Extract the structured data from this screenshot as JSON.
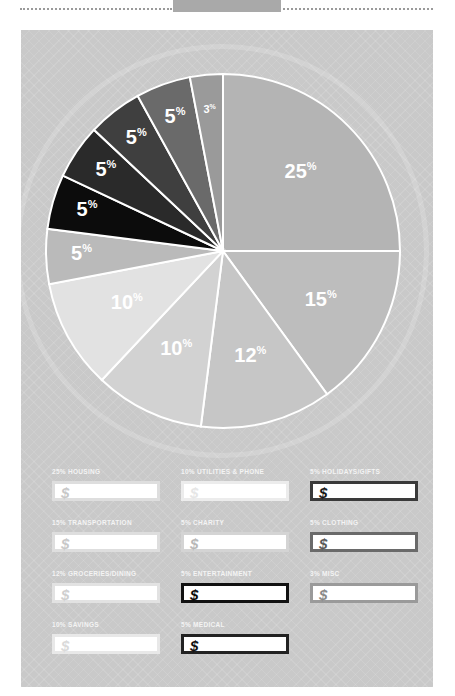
{
  "header": {
    "tab_color": "#a9a9a9"
  },
  "chart_data": {
    "type": "pie",
    "title": "",
    "start_angle": "12 o'clock, clockwise",
    "categories": [
      "Housing",
      "Transportation",
      "Groceries/Dining",
      "Savings",
      "Utilities & Phone",
      "Charity",
      "Entertainment",
      "Medical",
      "Holidays/Gifts",
      "Clothing",
      "Misc"
    ],
    "values": [
      25,
      15,
      12,
      10,
      10,
      5,
      5,
      5,
      5,
      5,
      3
    ],
    "labels": [
      "25%",
      "15%",
      "12%",
      "10%",
      "10%",
      "5%",
      "5%",
      "5%",
      "5%",
      "5%",
      "3%"
    ],
    "colors": [
      "#b4b4b4",
      "#bdbdbd",
      "#c6c6c6",
      "#d2d2d2",
      "#e2e2e2",
      "#bababa",
      "#0c0c0c",
      "#2a2a2a",
      "#3f3f3f",
      "#6a6a6a",
      "#9a9a9a"
    ],
    "label_colors": [
      "#ffffff",
      "#ffffff",
      "#ffffff",
      "#ffffff",
      "#ffffff",
      "#ffffff",
      "#ffffff",
      "#ffffff",
      "#ffffff",
      "#ffffff",
      "#ffffff"
    ]
  },
  "budget_fields": [
    {
      "label": "25% Housing",
      "currency": "$",
      "border": "#dedede",
      "dollar_color": "#c8c8c8"
    },
    {
      "label": "10% Utilities & Phone",
      "currency": "$",
      "border": "#ececec",
      "dollar_color": "#e6e6e6"
    },
    {
      "label": "5% Holidays/Gifts",
      "currency": "$",
      "border": "#3a3a3a",
      "dollar_color": "#1a1a1a"
    },
    {
      "label": "15% Transportation",
      "currency": "$",
      "border": "#dedede",
      "dollar_color": "#c8c8c8"
    },
    {
      "label": "5% Charity",
      "currency": "$",
      "border": "#d4d4d4",
      "dollar_color": "#b8b8b8"
    },
    {
      "label": "5% Clothing",
      "currency": "$",
      "border": "#6a6a6a",
      "dollar_color": "#5a5a5a"
    },
    {
      "label": "12% Groceries/Dining",
      "currency": "$",
      "border": "#e2e2e2",
      "dollar_color": "#cfcfcf"
    },
    {
      "label": "5% Entertainment",
      "currency": "$",
      "border": "#111111",
      "dollar_color": "#0c0c0c"
    },
    {
      "label": "3% Misc",
      "currency": "$",
      "border": "#9a9a9a",
      "dollar_color": "#8a8a8a"
    },
    {
      "label": "10% Savings",
      "currency": "$",
      "border": "#e8e8e8",
      "dollar_color": "#dadada"
    },
    {
      "label": "5% Medical",
      "currency": "$",
      "border": "#222222",
      "dollar_color": "#111111"
    }
  ]
}
